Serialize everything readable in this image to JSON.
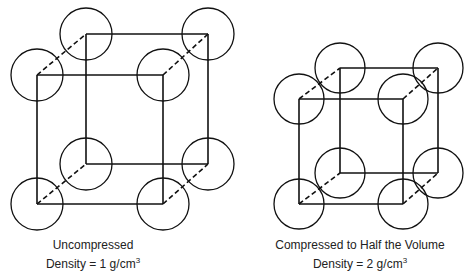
{
  "diagrams": [
    {
      "label_line1": "Uncompressed",
      "label_line2": "Density = 1 g/cm",
      "label_sup": "3",
      "front": {
        "tl": [
          37,
          75
        ],
        "tr": [
          163,
          75
        ],
        "bl": [
          37,
          204
        ],
        "br": [
          163,
          204
        ]
      },
      "back": {
        "tl": [
          86,
          34
        ],
        "tr": [
          208,
          34
        ],
        "bl": [
          86,
          164
        ],
        "br": [
          208,
          164
        ]
      },
      "radius": 26
    },
    {
      "label_line1": "Compressed to Half the Volume",
      "label_line2": "Density = 2 g/cm",
      "label_sup": "3",
      "front": {
        "tl": [
          299,
          99
        ],
        "tr": [
          403,
          99
        ],
        "bl": [
          299,
          204
        ],
        "br": [
          403,
          204
        ]
      },
      "back": {
        "tl": [
          340,
          68
        ],
        "tr": [
          438,
          68
        ],
        "bl": [
          340,
          173
        ],
        "br": [
          438,
          173
        ]
      },
      "radius": 25
    }
  ]
}
